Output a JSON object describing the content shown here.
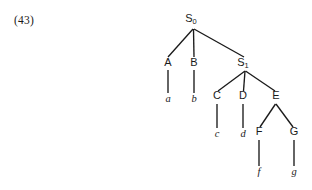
{
  "figure": {
    "example_number": "(43)",
    "caption": "",
    "colors": {
      "ink": "#1a1a1a",
      "background": "#ffffff"
    }
  },
  "tree": {
    "type": "syntax-tree",
    "root": "S0",
    "nodes": [
      {
        "id": "S0",
        "label": "S",
        "subscript": "0",
        "kind": "nonterminal",
        "x": 193,
        "y": 22
      },
      {
        "id": "A",
        "label": "A",
        "subscript": "",
        "kind": "nonterminal",
        "x": 168,
        "y": 66
      },
      {
        "id": "B",
        "label": "B",
        "subscript": "",
        "kind": "nonterminal",
        "x": 194,
        "y": 66
      },
      {
        "id": "S1",
        "label": "S",
        "subscript": "1",
        "kind": "nonterminal",
        "x": 245,
        "y": 66
      },
      {
        "id": "C",
        "label": "C",
        "subscript": "",
        "kind": "nonterminal",
        "x": 217,
        "y": 99
      },
      {
        "id": "D",
        "label": "D",
        "subscript": "",
        "kind": "nonterminal",
        "x": 243,
        "y": 99
      },
      {
        "id": "E",
        "label": "E",
        "subscript": "",
        "kind": "nonterminal",
        "x": 276,
        "y": 99
      },
      {
        "id": "F",
        "label": "F",
        "subscript": "",
        "kind": "nonterminal",
        "x": 259,
        "y": 135
      },
      {
        "id": "G",
        "label": "G",
        "subscript": "",
        "kind": "nonterminal",
        "x": 294,
        "y": 135
      },
      {
        "id": "a",
        "label": "a",
        "subscript": "",
        "kind": "terminal",
        "x": 168,
        "y": 102
      },
      {
        "id": "b",
        "label": "b",
        "subscript": "",
        "kind": "terminal",
        "x": 194,
        "y": 102
      },
      {
        "id": "c",
        "label": "c",
        "subscript": "",
        "kind": "terminal",
        "x": 217,
        "y": 137
      },
      {
        "id": "d",
        "label": "d",
        "subscript": "",
        "kind": "terminal",
        "x": 243,
        "y": 137
      },
      {
        "id": "f",
        "label": "f",
        "subscript": "",
        "kind": "terminal",
        "x": 259,
        "y": 175
      },
      {
        "id": "g",
        "label": "g",
        "subscript": "",
        "kind": "terminal",
        "x": 294,
        "y": 175
      }
    ],
    "edges": [
      {
        "from": "S0",
        "to": "A",
        "x1": 193,
        "y1": 29,
        "x2": 168,
        "y2": 57
      },
      {
        "from": "S0",
        "to": "B",
        "x1": 193.5,
        "y1": 29,
        "x2": 194,
        "y2": 57
      },
      {
        "from": "S0",
        "to": "S1",
        "x1": 194,
        "y1": 29,
        "x2": 244,
        "y2": 57
      },
      {
        "from": "A",
        "to": "a",
        "x1": 168,
        "y1": 70,
        "x2": 168,
        "y2": 93
      },
      {
        "from": "B",
        "to": "b",
        "x1": 194,
        "y1": 70,
        "x2": 194,
        "y2": 93
      },
      {
        "from": "S1",
        "to": "C",
        "x1": 245,
        "y1": 71,
        "x2": 218,
        "y2": 91
      },
      {
        "from": "S1",
        "to": "D",
        "x1": 245,
        "y1": 71,
        "x2": 243.5,
        "y2": 91
      },
      {
        "from": "S1",
        "to": "E",
        "x1": 245.5,
        "y1": 71,
        "x2": 275,
        "y2": 91
      },
      {
        "from": "C",
        "to": "c",
        "x1": 217,
        "y1": 104,
        "x2": 217,
        "y2": 128
      },
      {
        "from": "D",
        "to": "d",
        "x1": 243,
        "y1": 104,
        "x2": 243,
        "y2": 128
      },
      {
        "from": "E",
        "to": "F",
        "x1": 275.5,
        "y1": 104,
        "x2": 260,
        "y2": 127
      },
      {
        "from": "E",
        "to": "G",
        "x1": 276,
        "y1": 104,
        "x2": 293,
        "y2": 127
      },
      {
        "from": "F",
        "to": "f",
        "x1": 259,
        "y1": 140,
        "x2": 259,
        "y2": 166
      },
      {
        "from": "G",
        "to": "g",
        "x1": 294,
        "y1": 140,
        "x2": 294,
        "y2": 166
      }
    ]
  }
}
